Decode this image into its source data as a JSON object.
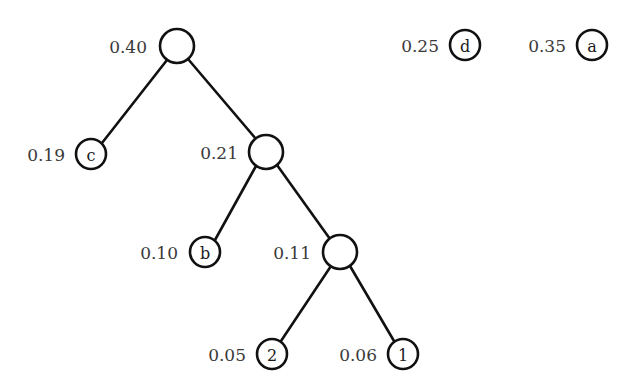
{
  "diagram": {
    "type": "binary-merge-tree",
    "background_color": "#ffffff",
    "stroke_color": "#111111",
    "label_color": "#3a3a3a",
    "nodes": [
      {
        "id": "root",
        "label": "",
        "weight": "0.40",
        "kind": "internal",
        "cx": 177,
        "cy": 46,
        "r": 17,
        "label_x": 147,
        "label_y": 46
      },
      {
        "id": "c",
        "label": "c",
        "weight": "0.19",
        "kind": "leaf",
        "cx": 91,
        "cy": 154,
        "r": 15,
        "label_x": 65,
        "label_y": 154
      },
      {
        "id": "n021",
        "label": "",
        "weight": "0.21",
        "kind": "internal",
        "cx": 266,
        "cy": 152,
        "r": 17,
        "label_x": 238,
        "label_y": 152
      },
      {
        "id": "b",
        "label": "b",
        "weight": "0.10",
        "kind": "leaf",
        "cx": 205,
        "cy": 252,
        "r": 15,
        "label_x": 178,
        "label_y": 252
      },
      {
        "id": "n011",
        "label": "",
        "weight": "0.11",
        "kind": "internal",
        "cx": 340,
        "cy": 252,
        "r": 17,
        "label_x": 311,
        "label_y": 252
      },
      {
        "id": "two",
        "label": "2",
        "weight": "0.05",
        "kind": "leaf",
        "cx": 272,
        "cy": 354,
        "r": 15,
        "label_x": 246,
        "label_y": 354
      },
      {
        "id": "one",
        "label": "1",
        "weight": "0.06",
        "kind": "leaf",
        "cx": 403,
        "cy": 354,
        "r": 15,
        "label_x": 377,
        "label_y": 354
      },
      {
        "id": "d",
        "label": "d",
        "weight": "0.25",
        "kind": "leaf",
        "cx": 465,
        "cy": 45,
        "r": 15,
        "label_x": 439,
        "label_y": 45
      },
      {
        "id": "a",
        "label": "a",
        "weight": "0.35",
        "kind": "leaf",
        "cx": 592,
        "cy": 45,
        "r": 15,
        "label_x": 566,
        "label_y": 45
      }
    ],
    "edges": [
      {
        "id": "root-c",
        "from": "root",
        "to": "c",
        "x1": 167,
        "y1": 60,
        "x2": 102,
        "y2": 143
      },
      {
        "id": "root-n021",
        "from": "root",
        "to": "n021",
        "x1": 188,
        "y1": 59,
        "x2": 256,
        "y2": 139
      },
      {
        "id": "n021-b",
        "from": "n021",
        "to": "b",
        "x1": 256,
        "y1": 166,
        "x2": 215,
        "y2": 240
      },
      {
        "id": "n021-n011",
        "from": "n021",
        "to": "n011",
        "x1": 277,
        "y1": 165,
        "x2": 330,
        "y2": 239
      },
      {
        "id": "n011-two",
        "from": "n011",
        "to": "two",
        "x1": 331,
        "y1": 266,
        "x2": 281,
        "y2": 341
      },
      {
        "id": "n011-one",
        "from": "n011",
        "to": "one",
        "x1": 350,
        "y1": 266,
        "x2": 394,
        "y2": 341
      }
    ]
  }
}
